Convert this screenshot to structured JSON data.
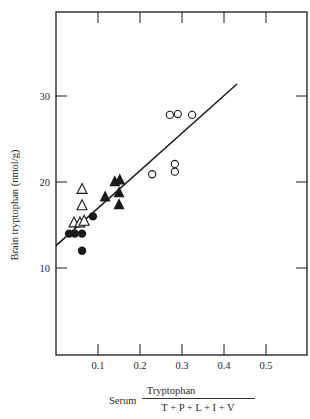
{
  "chart_data": {
    "type": "scatter",
    "title": "",
    "xlabel": {
      "prefix": "Serum",
      "numerator": "Tryptophan",
      "denominator": "T + P + L + I + V"
    },
    "ylabel": "Brain tryptophan (nmol/g)",
    "xlim": [
      0,
      0.6
    ],
    "ylim": [
      0,
      40
    ],
    "x_ticks": [
      0.1,
      0.2,
      0.3,
      0.4,
      0.5
    ],
    "x_tick_labels": [
      "0.1",
      "0.2",
      "0.3",
      "0.4",
      "0.5"
    ],
    "y_ticks": [
      10,
      20,
      30
    ],
    "y_tick_labels": [
      "10",
      "20",
      "30"
    ],
    "grid": false,
    "legend": null,
    "series": [
      {
        "name": "filled-circles",
        "marker": "filled-circle",
        "points": [
          [
            0.031,
            14.0
          ],
          [
            0.045,
            14.0
          ],
          [
            0.062,
            14.0
          ],
          [
            0.062,
            12.0
          ],
          [
            0.088,
            16.0
          ]
        ]
      },
      {
        "name": "open-triangles",
        "marker": "open-triangle",
        "points": [
          [
            0.062,
            19.2
          ],
          [
            0.062,
            17.3
          ],
          [
            0.043,
            15.3
          ],
          [
            0.057,
            15.3
          ],
          [
            0.067,
            15.5
          ]
        ]
      },
      {
        "name": "filled-triangles",
        "marker": "filled-triangle",
        "points": [
          [
            0.117,
            18.3
          ],
          [
            0.14,
            20.1
          ],
          [
            0.152,
            20.3
          ],
          [
            0.15,
            18.8
          ],
          [
            0.15,
            17.4
          ]
        ]
      },
      {
        "name": "open-circles",
        "marker": "open-circle",
        "points": [
          [
            0.271,
            27.8
          ],
          [
            0.29,
            27.9
          ],
          [
            0.324,
            27.8
          ],
          [
            0.229,
            20.9
          ],
          [
            0.283,
            22.1
          ],
          [
            0.283,
            21.2
          ]
        ]
      }
    ],
    "regression_line": {
      "x": [
        0.0,
        0.431
      ],
      "y": [
        12.6,
        31.4
      ]
    }
  },
  "colors": {
    "ink": "#1a1a1a",
    "background": "#ffffff"
  }
}
